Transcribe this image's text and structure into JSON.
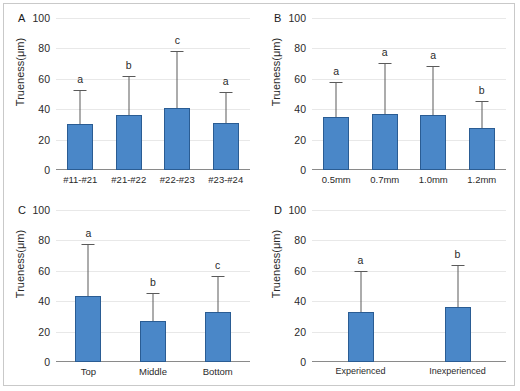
{
  "figure": {
    "y_axis_label": "Trueness(μm)",
    "y_ticks": [
      "100",
      "80",
      "60",
      "40",
      "20",
      "0"
    ],
    "bar_color": "#4a87c8",
    "bar_border_color": "#2a5c93",
    "error_bar_color": "#5a5a5a",
    "gridline_color": "#e8e8e8",
    "frame_color": "#c9c9c9"
  },
  "chart_data": [
    {
      "type": "bar",
      "panel": "A",
      "title": "",
      "xlabel": "",
      "ylabel": "Trueness(μm)",
      "ylim": [
        0,
        100
      ],
      "yticks": [
        0,
        20,
        40,
        60,
        80,
        100
      ],
      "grid": true,
      "legend": "none",
      "categories": [
        "#11-#21",
        "#21-#22",
        "#22-#23",
        "#23-#24"
      ],
      "values": [
        30,
        36,
        40.5,
        31
      ],
      "errors_upper": [
        22,
        25,
        37,
        19.5
      ],
      "error_tops": [
        52,
        61,
        77.5,
        50.5
      ],
      "significance_letters": [
        "a",
        "b",
        "c",
        "a"
      ]
    },
    {
      "type": "bar",
      "panel": "B",
      "title": "",
      "xlabel": "",
      "ylabel": "Trueness(μm)",
      "ylim": [
        0,
        100
      ],
      "yticks": [
        0,
        20,
        40,
        60,
        80,
        100
      ],
      "grid": true,
      "legend": "none",
      "categories": [
        "0.5mm",
        "0.7mm",
        "1.0mm",
        "1.2mm"
      ],
      "values": [
        35,
        37,
        36.5,
        27.5
      ],
      "errors_upper": [
        22.5,
        33,
        31.5,
        17
      ],
      "error_tops": [
        57.5,
        70,
        68,
        44.5
      ],
      "significance_letters": [
        "a",
        "a",
        "a",
        "b"
      ]
    },
    {
      "type": "bar",
      "panel": "C",
      "title": "",
      "xlabel": "",
      "ylabel": "Trueness(μm)",
      "ylim": [
        0,
        100
      ],
      "yticks": [
        0,
        20,
        40,
        60,
        80,
        100
      ],
      "grid": true,
      "legend": "none",
      "categories": [
        "Top",
        "Middle",
        "Bottom"
      ],
      "values": [
        43.5,
        27,
        33
      ],
      "errors_upper": [
        33.5,
        18,
        23
      ],
      "error_tops": [
        77,
        45,
        56
      ],
      "significance_letters": [
        "a",
        "b",
        "c"
      ]
    },
    {
      "type": "bar",
      "panel": "D",
      "title": "",
      "xlabel": "",
      "ylabel": "Trueness(μm)",
      "ylim": [
        0,
        100
      ],
      "yticks": [
        0,
        20,
        40,
        60,
        80,
        100
      ],
      "grid": true,
      "legend": "none",
      "categories": [
        "Experienced",
        "Inexperienced"
      ],
      "values": [
        33,
        36
      ],
      "errors_upper": [
        26.5,
        27
      ],
      "error_tops": [
        59.5,
        63
      ],
      "significance_letters": [
        "a",
        "b"
      ]
    }
  ],
  "panels": {
    "A": {
      "letter": "A"
    },
    "B": {
      "letter": "B"
    },
    "C": {
      "letter": "C"
    },
    "D": {
      "letter": "D"
    }
  }
}
